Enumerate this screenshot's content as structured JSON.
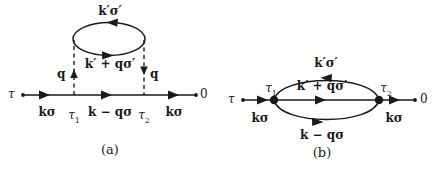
{
  "figure": {
    "background_color": "#ffffff",
    "line_color": "#1a1a1a",
    "type": "feynman-diagrams",
    "caption_a": "(a)",
    "caption_b": "(b)"
  },
  "diagram_a": {
    "name": "self-energy-diagram-a",
    "caption": "(a)",
    "endpoint_left_label": "τ",
    "endpoint_right_label": "0",
    "vertex_labels": {
      "left": "τ",
      "left_sub": "1",
      "right": "τ",
      "right_sub": "2"
    },
    "propagator_labels": {
      "incoming": "kσ",
      "middle": "k − qσ",
      "outgoing": "kσ"
    },
    "loop_labels": {
      "top": "k′σ′",
      "bottom": "k′ + qσ′"
    },
    "interaction_labels": {
      "left": "q",
      "right": "q"
    }
  },
  "diagram_b": {
    "name": "self-energy-diagram-b",
    "caption": "(b)",
    "endpoint_left_label": "τ",
    "endpoint_right_label": "0",
    "vertex_labels": {
      "left": "τ",
      "left_sub": "1",
      "right": "τ",
      "right_sub": "2"
    },
    "propagator_labels": {
      "incoming": "kσ",
      "outgoing": "kσ"
    },
    "loop_labels": {
      "top": "k′σ′",
      "middle": "k′ + qσ′",
      "bottom": "k − qσ"
    }
  }
}
